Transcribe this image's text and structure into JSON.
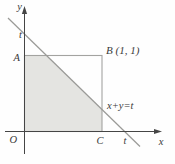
{
  "figure": {
    "labels": {
      "y_axis": "y",
      "x_axis": "x",
      "t_on_y_axis": "t",
      "t_on_x_axis": "t",
      "origin": "O",
      "vertex_a": "A",
      "vertex_b": "B (1, 1)",
      "vertex_c": "C",
      "line_equation": "x+y=t"
    },
    "colors": {
      "axis": "#454545",
      "diagonal_line": "#9a9a97",
      "square_edge": "#a3a3a0",
      "shaded_fill": "#e4e4e1",
      "label_text": "#3a3a3a",
      "background": "#fefefe"
    }
  }
}
